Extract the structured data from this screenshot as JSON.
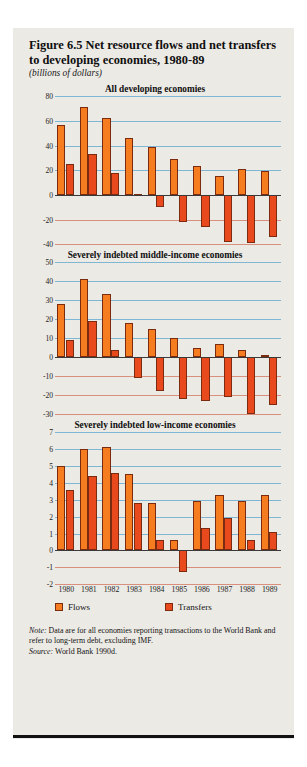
{
  "figure": {
    "title": "Figure 6.5  Net resource flows and net transfers to developing economies, 1980-89",
    "subtitle": "(billions of dollars)"
  },
  "legend": {
    "flows_label": "Flows",
    "transfers_label": "Transfers"
  },
  "note": {
    "note_label": "Note:",
    "note_text": " Data are for all economies reporting transactions to the World Bank and refer to long-term debt, excluding IMF.",
    "source_label": "Source:",
    "source_text": " World Bank 1990d."
  },
  "colors": {
    "flows": "#f57c1f",
    "transfers": "#e8491d",
    "grid_positive": "#7fb6d4",
    "grid_negative": "#d98f7e",
    "paper": "#eceae5"
  },
  "chart_data": [
    {
      "type": "bar",
      "title": "All developing economies",
      "xlabel": "",
      "ylabel": "",
      "categories": [
        "1980",
        "1981",
        "1982",
        "1983",
        "1984",
        "1985",
        "1986",
        "1987",
        "1988",
        "1989"
      ],
      "yticks": [
        80,
        60,
        40,
        20,
        0,
        -20,
        -40
      ],
      "ylim": [
        -40,
        80
      ],
      "grid": true,
      "legend_position": "bottom",
      "series": [
        {
          "name": "Flows",
          "values": [
            57,
            71,
            62,
            46,
            39,
            29,
            23,
            15,
            21,
            19
          ]
        },
        {
          "name": "Transfers",
          "values": [
            25,
            33,
            18,
            1,
            -10,
            -22,
            -26,
            -38,
            -39,
            -34
          ]
        }
      ]
    },
    {
      "type": "bar",
      "title": "Severely indebted middle-income economies",
      "xlabel": "",
      "ylabel": "",
      "categories": [
        "1980",
        "1981",
        "1982",
        "1983",
        "1984",
        "1985",
        "1986",
        "1987",
        "1988",
        "1989"
      ],
      "yticks": [
        50,
        40,
        30,
        20,
        10,
        0,
        -10,
        -20,
        -30
      ],
      "ylim": [
        -30,
        50
      ],
      "grid": true,
      "legend_position": "bottom",
      "series": [
        {
          "name": "Flows",
          "values": [
            28,
            41,
            33,
            18,
            15,
            10,
            5,
            7,
            4,
            1
          ]
        },
        {
          "name": "Transfers",
          "values": [
            9,
            19,
            4,
            -11,
            -18,
            -22,
            -23,
            -21,
            -30,
            -25
          ]
        }
      ]
    },
    {
      "type": "bar",
      "title": "Severely indebted low-income economies",
      "xlabel": "",
      "ylabel": "",
      "categories": [
        "1980",
        "1981",
        "1982",
        "1983",
        "1984",
        "1985",
        "1986",
        "1987",
        "1988",
        "1989"
      ],
      "yticks": [
        7,
        6,
        5,
        4,
        3,
        2,
        1,
        0,
        -1,
        -2
      ],
      "ylim": [
        -2,
        7
      ],
      "grid": true,
      "legend_position": "bottom",
      "series": [
        {
          "name": "Flows",
          "values": [
            5.0,
            6.0,
            6.1,
            4.5,
            2.8,
            0.6,
            2.9,
            3.3,
            2.9,
            3.3
          ]
        },
        {
          "name": "Transfers",
          "values": [
            3.6,
            4.4,
            4.6,
            2.8,
            0.6,
            -1.3,
            1.3,
            1.9,
            0.6,
            1.1
          ]
        }
      ]
    }
  ]
}
